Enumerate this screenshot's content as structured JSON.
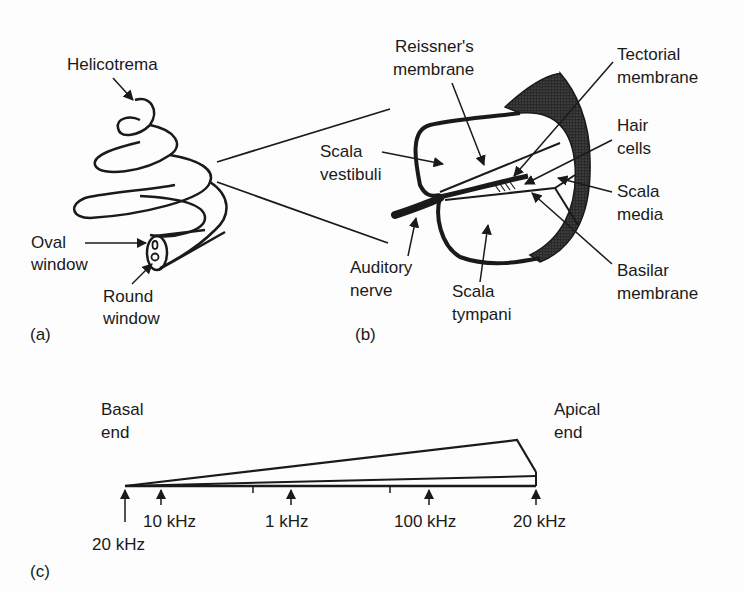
{
  "panel_a": {
    "tag": "(a)",
    "labels": {
      "helicotrema": "Helicotrema",
      "oval_window_1": "Oval",
      "oval_window_2": "window",
      "round_window_1": "Round",
      "round_window_2": "window"
    }
  },
  "panel_b": {
    "tag": "(b)",
    "labels": {
      "reissner_1": "Reissner's",
      "reissner_2": "membrane",
      "tectorial_1": "Tectorial",
      "tectorial_2": "membrane",
      "hair_1": "Hair",
      "hair_2": "cells",
      "vestibuli_1": "Scala",
      "vestibuli_2": "vestibuli",
      "media_1": "Scala",
      "media_2": "media",
      "auditory_1": "Auditory",
      "auditory_2": "nerve",
      "tympani_1": "Scala",
      "tympani_2": "tympani",
      "basilar_1": "Basilar",
      "basilar_2": "membrane"
    }
  },
  "panel_c": {
    "tag": "(c)",
    "basal_1": "Basal",
    "basal_2": "end",
    "apical_1": "Apical",
    "apical_2": "end",
    "frequency_marks": [
      {
        "label": "20 kHz",
        "x": 125
      },
      {
        "label": "10 kHz",
        "x": 161
      },
      {
        "label": "1 kHz",
        "x": 291
      },
      {
        "label": "100 kHz",
        "x": 429
      },
      {
        "label": "20 kHz",
        "x": 536
      }
    ]
  },
  "colors": {
    "ink": "#1a1a1a",
    "background": "#fdfdfd"
  }
}
